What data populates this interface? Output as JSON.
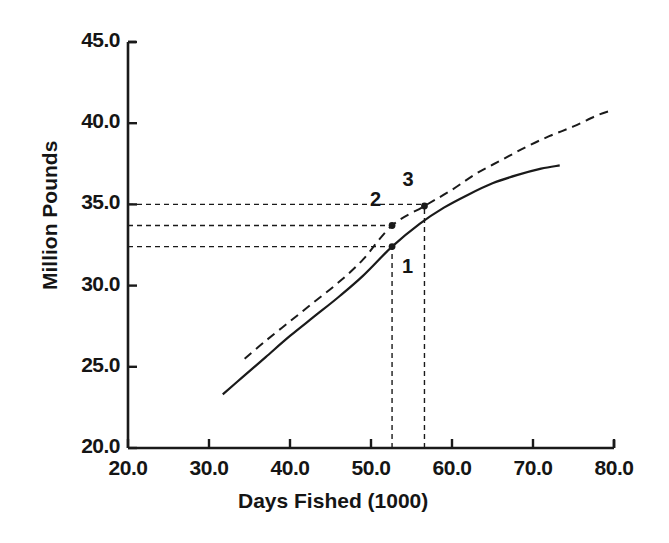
{
  "chart_data": {
    "type": "line",
    "title": "",
    "xlabel": "Days Fished (1000)",
    "ylabel": "Million Pounds",
    "xlim": [
      20.0,
      80.0
    ],
    "ylim": [
      20.0,
      45.0
    ],
    "xticks": [
      "20.0",
      "30.0",
      "40.0",
      "50.0",
      "60.0",
      "70.0",
      "80.0"
    ],
    "xtick_values": [
      20.0,
      30.0,
      40.0,
      50.0,
      60.0,
      70.0,
      80.0
    ],
    "yticks": [
      "20.0",
      "25.0",
      "30.0",
      "35.0",
      "40.0",
      "45.0"
    ],
    "ytick_values": [
      20.0,
      25.0,
      30.0,
      35.0,
      40.0,
      45.0
    ],
    "grid": false,
    "legend": "none",
    "series": [
      {
        "name": "solid-yield-curve",
        "style": "solid",
        "color": "#1a1a1a",
        "x": [
          31.7,
          34.0,
          37.0,
          40.0,
          43.0,
          46.0,
          49.0,
          52.6,
          56.0,
          59.0,
          62.0,
          65.0,
          68.0,
          71.0,
          73.3
        ],
        "y": [
          23.3,
          24.3,
          25.6,
          26.9,
          28.1,
          29.3,
          30.6,
          32.4,
          33.8,
          34.8,
          35.6,
          36.3,
          36.8,
          37.2,
          37.4
        ]
      },
      {
        "name": "dashed-yield-curve",
        "style": "dashed",
        "color": "#1a1a1a",
        "x": [
          34.4,
          37.0,
          40.0,
          43.0,
          46.0,
          49.0,
          52.6,
          56.6,
          60.0,
          63.0,
          66.0,
          69.0,
          72.0,
          75.0,
          78.0,
          79.8
        ],
        "y": [
          25.5,
          26.6,
          27.8,
          29.0,
          30.2,
          31.6,
          33.7,
          34.9,
          35.9,
          36.9,
          37.7,
          38.5,
          39.2,
          39.8,
          40.5,
          40.8
        ]
      }
    ],
    "annotations": [
      {
        "label": "1",
        "x": 52.6,
        "y": 32.4,
        "marker": "dot",
        "on": "solid-yield-curve",
        "label_pos": "below-right"
      },
      {
        "label": "2",
        "x": 52.6,
        "y": 33.7,
        "marker": "dot",
        "on": "dashed-yield-curve",
        "label_pos": "above-left"
      },
      {
        "label": "3",
        "x": 56.6,
        "y": 34.9,
        "marker": "dot",
        "on": "dashed-yield-curve",
        "label_pos": "above-left"
      }
    ],
    "guide_lines": {
      "horizontal_values": [
        35.0,
        33.7,
        32.4
      ],
      "vertical_values": [
        52.6,
        56.6
      ],
      "style": "dotted"
    }
  },
  "axes": {
    "x_axis_name": "x-axis",
    "y_axis_name": "y-axis"
  }
}
